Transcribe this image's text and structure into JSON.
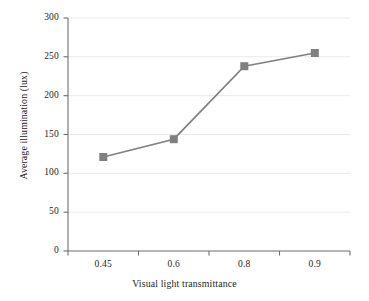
{
  "chart_data": {
    "type": "line",
    "title": "",
    "subtitle": "",
    "xlabel": "Visual light transmittance",
    "ylabel": "Average illumination (lux)",
    "categories": [
      "0.45",
      "0.6",
      "0.8",
      "0.9"
    ],
    "values": [
      121,
      144,
      238,
      255
    ],
    "series": [
      {
        "name": "Average illumination",
        "values": [
          121,
          144,
          238,
          255
        ]
      }
    ],
    "yticks": [
      "0",
      "50",
      "100",
      "150",
      "200",
      "250",
      "300"
    ],
    "ytick_values": [
      0,
      50,
      100,
      150,
      200,
      250,
      300
    ],
    "xtick_labels": [
      "0.45",
      "0.6",
      "0.8",
      "0.9"
    ],
    "ylim": [
      0,
      300
    ],
    "grid": "horizontal",
    "legend": "none",
    "marker": "square",
    "colors": {
      "line": "#808080",
      "marker": "#808080",
      "axis": "#58595b",
      "grid": "#e8e8e8",
      "text": "#231f20",
      "background": "#ffffff"
    }
  },
  "axes": {
    "y_tick_labels": [
      "300",
      "250",
      "200",
      "150",
      "100",
      "50",
      "0"
    ],
    "x_tick_labels": [
      "0.45",
      "0.6",
      "0.8",
      "0.9"
    ],
    "y_title": "Average illumination (lux)",
    "x_title": "Visual light transmittance"
  }
}
